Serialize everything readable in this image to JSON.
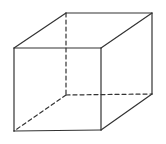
{
  "diagram": {
    "type": "cube-wireframe",
    "stroke_color": "#333333",
    "background": "#ffffff",
    "vertices": {
      "front_top_left": [
        14,
        48
      ],
      "front_top_right": [
        101,
        48
      ],
      "front_bottom_right": [
        101,
        130
      ],
      "front_bottom_left": [
        14,
        131
      ],
      "back_top_left": [
        66,
        13
      ],
      "back_top_right": [
        152,
        13
      ],
      "back_bottom_right": [
        152,
        94
      ],
      "back_bottom_left": [
        66,
        95
      ]
    },
    "visible_edges": [
      [
        "front_top_left",
        "front_top_right"
      ],
      [
        "front_top_right",
        "front_bottom_right"
      ],
      [
        "front_bottom_right",
        "front_bottom_left"
      ],
      [
        "front_bottom_left",
        "front_top_left"
      ],
      [
        "front_top_left",
        "back_top_left"
      ],
      [
        "back_top_left",
        "back_top_right"
      ],
      [
        "front_top_right",
        "back_top_right"
      ],
      [
        "back_top_right",
        "back_bottom_right"
      ],
      [
        "front_bottom_right",
        "back_bottom_right"
      ]
    ],
    "hidden_edges": [
      [
        "back_top_left",
        "back_bottom_left"
      ],
      [
        "back_bottom_left",
        "back_bottom_right"
      ],
      [
        "back_bottom_left",
        "front_bottom_left"
      ]
    ]
  }
}
